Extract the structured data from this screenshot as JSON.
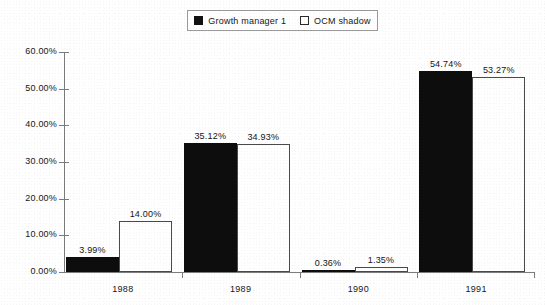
{
  "legend": {
    "entries": [
      {
        "label": "Growth manager 1",
        "swatch": "filled-square-icon",
        "color": "#0d0d0d"
      },
      {
        "label": "OCM  shadow",
        "swatch": "hollow-square-icon",
        "color": "#ffffff"
      }
    ]
  },
  "chart_data": {
    "type": "bar",
    "title": "",
    "subtitle": "",
    "xlabel": "",
    "ylabel": "",
    "categories": [
      "1988",
      "1989",
      "1990",
      "1991"
    ],
    "series": [
      {
        "name": "Growth manager 1",
        "color": "#0d0d0d",
        "values": [
          3.99,
          35.12,
          0.36,
          54.74
        ],
        "labels": [
          "3.99%",
          "35.12%",
          "0.36%",
          "54.74%"
        ]
      },
      {
        "name": "OCM  shadow",
        "color": "#ffffff",
        "values": [
          14.0,
          34.93,
          1.35,
          53.27
        ],
        "labels": [
          "14.00%",
          "34.93%",
          "1.35%",
          "53.27%"
        ]
      }
    ],
    "ylim": [
      0,
      60
    ],
    "ytick_values": [
      0,
      10,
      20,
      30,
      40,
      50,
      60
    ],
    "ytick_labels": [
      "0.00%",
      "10.00%",
      "20.00%",
      "30.00%",
      "40.00%",
      "50.00%",
      "60.00%"
    ],
    "grid": false,
    "legend_position": "top-center",
    "axis_color": "#7c7c7c"
  }
}
